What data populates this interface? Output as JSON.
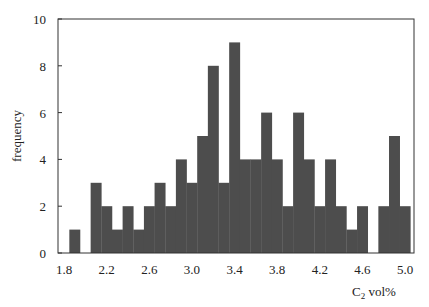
{
  "chart_data": {
    "type": "bar",
    "subtype": "histogram",
    "title": "",
    "xlabel": "C2 vol%",
    "xlabel_main": "C",
    "xlabel_sub": "2",
    "xlabel_rest": " vol%",
    "ylabel": "frequency",
    "xlim": [
      1.8,
      5.1
    ],
    "ylim": [
      0,
      10
    ],
    "bin_width": 0.1,
    "x_ticks": [
      1.8,
      2.2,
      2.6,
      3.0,
      3.4,
      3.8,
      4.2,
      4.6,
      5.0
    ],
    "x_tick_labels": [
      "1.8",
      "2.2",
      "2.6",
      "3.0",
      "3.4",
      "3.8",
      "4.2",
      "4.6",
      "5.0"
    ],
    "y_ticks": [
      0,
      2,
      4,
      6,
      8,
      10
    ],
    "y_tick_labels": [
      "0",
      "2",
      "4",
      "6",
      "8",
      "10"
    ],
    "grid": false,
    "legend": null,
    "bar_color": "#4d4d4d",
    "categories": [
      "1.9",
      "2.0",
      "2.1",
      "2.2",
      "2.3",
      "2.4",
      "2.5",
      "2.6",
      "2.7",
      "2.8",
      "2.9",
      "3.0",
      "3.1",
      "3.2",
      "3.3",
      "3.4",
      "3.5",
      "3.6",
      "3.7",
      "3.8",
      "3.9",
      "4.0",
      "4.1",
      "4.2",
      "4.3",
      "4.4",
      "4.5",
      "4.6",
      "4.7",
      "4.8",
      "4.9",
      "5.0"
    ],
    "values": [
      1,
      0,
      3,
      2,
      1,
      2,
      1,
      2,
      3,
      2,
      4,
      3,
      5,
      8,
      3,
      9,
      4,
      4,
      6,
      4,
      2,
      6,
      4,
      2,
      4,
      2,
      1,
      2,
      0,
      2,
      5,
      2
    ]
  }
}
